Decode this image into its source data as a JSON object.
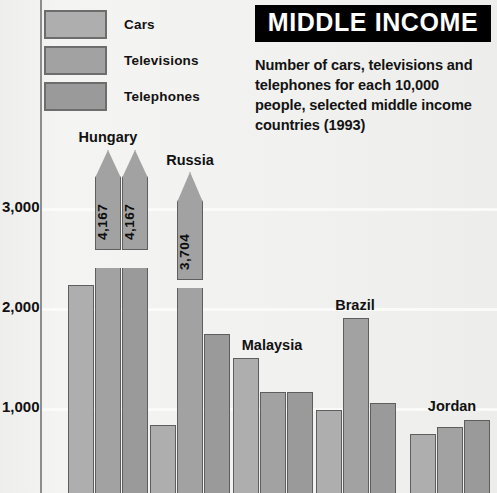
{
  "header": {
    "title": "MIDDLE INCOME",
    "subtitle": "Number of cars, televisions and telephones for each 10,000 people, selected middle income countries (1993)"
  },
  "legend": {
    "items": [
      {
        "label": "Cars",
        "color": "#aeaeae"
      },
      {
        "label": "Televisions",
        "color": "#a2a2a2"
      },
      {
        "label": "Telephones",
        "color": "#9a9a9a"
      }
    ]
  },
  "axis": {
    "ticks": [
      "3,000",
      "2,000",
      "1,000"
    ]
  },
  "chart_data": {
    "type": "bar",
    "title": "MIDDLE INCOME",
    "subtitle": "Number of cars, televisions and telephones for each 10,000 people, selected middle income countries (1993)",
    "xlabel": "",
    "ylabel": "",
    "ylim": [
      0,
      3400
    ],
    "yticks": [
      1000,
      2000,
      3000
    ],
    "ytick_labels": [
      "1,000",
      "2,000",
      "3,000"
    ],
    "grid": true,
    "legend_position": "top-left",
    "note": "Bars drawn with arrow tops exceed the plotted axis range; their true values are printed inside the bar.",
    "categories": [
      "Hungary",
      "Russia",
      "Malaysia",
      "Brazil",
      "Jordan"
    ],
    "series": [
      {
        "name": "Cars",
        "color": "#aeaeae",
        "values": [
          2230,
          830,
          1500,
          980,
          740
        ]
      },
      {
        "name": "Televisions",
        "color": "#a2a2a2",
        "values": [
          4167,
          3704,
          1160,
          1900,
          810
        ]
      },
      {
        "name": "Telephones",
        "color": "#9a9a9a",
        "values": [
          4167,
          1740,
          1160,
          1050,
          880
        ]
      }
    ],
    "off_scale_labels": [
      {
        "category": "Hungary",
        "series": "Televisions",
        "label": "4,167"
      },
      {
        "category": "Hungary",
        "series": "Telephones",
        "label": "4,167"
      },
      {
        "category": "Russia",
        "series": "Televisions",
        "label": "3,704"
      }
    ]
  },
  "bars": [
    {
      "name": "hungary-cars",
      "country": "Hungary",
      "series": "Cars",
      "value": 2230,
      "x": 68,
      "w": 26,
      "top": 285,
      "cls": "s-cars"
    },
    {
      "name": "hungary-tv",
      "country": "Hungary",
      "series": "Televisions",
      "value": 4167,
      "x": 95,
      "w": 26,
      "top": 268,
      "cls": "s-tv",
      "arrow": true,
      "arrow_top": 150,
      "arrow_h": 100,
      "label": "4,167"
    },
    {
      "name": "hungary-phones",
      "country": "Hungary",
      "series": "Telephones",
      "value": 4167,
      "x": 122,
      "w": 26,
      "top": 268,
      "cls": "s-phones",
      "arrow": true,
      "arrow_top": 150,
      "arrow_h": 100,
      "label": "4,167"
    },
    {
      "name": "russia-cars",
      "country": "Russia",
      "series": "Cars",
      "value": 830,
      "x": 150,
      "w": 26,
      "top": 425,
      "cls": "s-cars"
    },
    {
      "name": "russia-tv",
      "country": "Russia",
      "series": "Televisions",
      "value": 3704,
      "x": 177,
      "w": 26,
      "top": 288,
      "cls": "s-tv",
      "arrow": true,
      "arrow_top": 172,
      "arrow_h": 108,
      "label": "3,704"
    },
    {
      "name": "russia-phones",
      "country": "Russia",
      "series": "Telephones",
      "value": 1740,
      "x": 204,
      "w": 26,
      "top": 334,
      "cls": "s-phones"
    },
    {
      "name": "malaysia-cars",
      "country": "Malaysia",
      "series": "Cars",
      "value": 1500,
      "x": 233,
      "w": 26,
      "top": 358,
      "cls": "s-cars"
    },
    {
      "name": "malaysia-tv",
      "country": "Malaysia",
      "series": "Televisions",
      "value": 1160,
      "x": 260,
      "w": 26,
      "top": 392,
      "cls": "s-tv"
    },
    {
      "name": "malaysia-phones",
      "country": "Malaysia",
      "series": "Telephones",
      "value": 1160,
      "x": 287,
      "w": 26,
      "top": 392,
      "cls": "s-phones"
    },
    {
      "name": "brazil-cars",
      "country": "Brazil",
      "series": "Cars",
      "value": 980,
      "x": 316,
      "w": 26,
      "top": 410,
      "cls": "s-cars"
    },
    {
      "name": "brazil-tv",
      "country": "Brazil",
      "series": "Televisions",
      "value": 1900,
      "x": 343,
      "w": 26,
      "top": 318,
      "cls": "s-tv"
    },
    {
      "name": "brazil-phones",
      "country": "Brazil",
      "series": "Telephones",
      "value": 1050,
      "x": 370,
      "w": 26,
      "top": 403,
      "cls": "s-phones"
    },
    {
      "name": "jordan-cars",
      "country": "Jordan",
      "series": "Cars",
      "value": 740,
      "x": 410,
      "w": 26,
      "top": 434,
      "cls": "s-cars"
    },
    {
      "name": "jordan-tv",
      "country": "Jordan",
      "series": "Televisions",
      "value": 810,
      "x": 437,
      "w": 26,
      "top": 427,
      "cls": "s-tv"
    },
    {
      "name": "jordan-phones",
      "country": "Jordan",
      "series": "Telephones",
      "value": 880,
      "x": 464,
      "w": 26,
      "top": 420,
      "cls": "s-phones"
    }
  ],
  "country_labels": [
    {
      "label": "Hungary",
      "x": 108,
      "y": 129
    },
    {
      "label": "Russia",
      "x": 190,
      "y": 152
    },
    {
      "label": "Malaysia",
      "x": 272,
      "y": 337
    },
    {
      "label": "Brazil",
      "x": 355,
      "y": 297
    },
    {
      "label": "Jordan",
      "x": 452,
      "y": 398
    }
  ],
  "gridlines": [
    {
      "name": "gridline-3000",
      "y": 208
    },
    {
      "name": "gridline-2000",
      "y": 308
    },
    {
      "name": "gridline-1000",
      "y": 408
    }
  ],
  "ytick_positions": [
    {
      "label": "3,000",
      "y": 206
    },
    {
      "label": "2,000",
      "y": 306
    },
    {
      "label": "1,000",
      "y": 406
    }
  ]
}
